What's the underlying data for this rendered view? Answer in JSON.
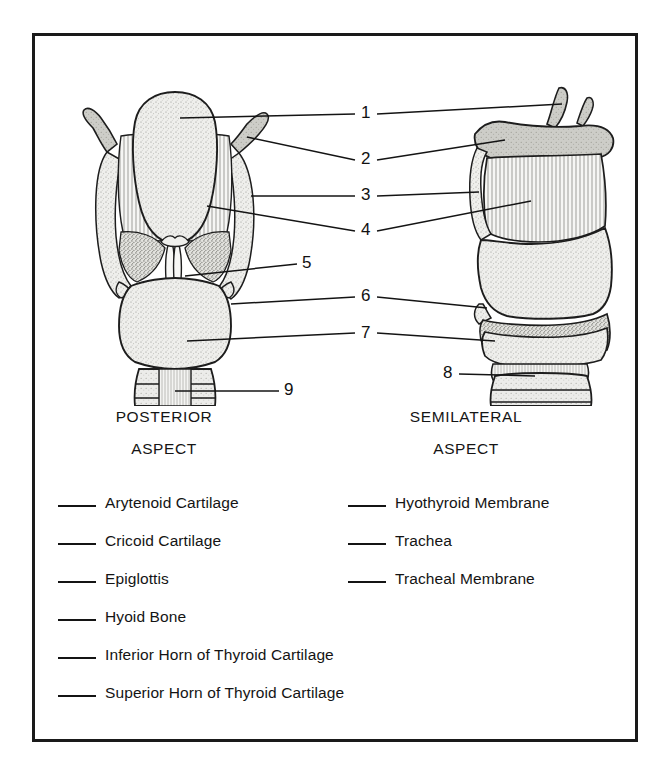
{
  "document": {
    "type": "anatomy-labeling-worksheet",
    "subject": "Larynx"
  },
  "figures": [
    {
      "id": "posterior",
      "caption_line1": "POSTERIOR",
      "caption_line2": "ASPECT"
    },
    {
      "id": "semilateral",
      "caption_line1": "SEMILATERAL",
      "caption_line2": "ASPECT"
    }
  ],
  "callouts": [
    {
      "number": "1",
      "x": 330,
      "y": 78,
      "target": "epiglottis"
    },
    {
      "number": "2",
      "x": 330,
      "y": 121,
      "target": "superior-horn-of-thyroid-cartilage"
    },
    {
      "number": "3",
      "x": 330,
      "y": 160,
      "target": "hyothyroid-membrane"
    },
    {
      "number": "4",
      "x": 330,
      "y": 192,
      "target": "hyothyroid-membrane-body"
    },
    {
      "number": "5",
      "x": 271,
      "y": 228,
      "target": "arytenoid-cartilage"
    },
    {
      "number": "6",
      "x": 330,
      "y": 261,
      "target": "inferior-horn-of-thyroid-cartilage"
    },
    {
      "number": "7",
      "x": 330,
      "y": 297,
      "target": "cricoid-cartilage"
    },
    {
      "number": "8",
      "x": 412,
      "y": 338,
      "target": "tracheal-membrane"
    },
    {
      "number": "9",
      "x": 253,
      "y": 353,
      "target": "trachea"
    }
  ],
  "answer_key": {
    "left_column": [
      {
        "label": "Arytenoid Cartilage"
      },
      {
        "label": "Cricoid Cartilage"
      },
      {
        "label": "Epiglottis"
      },
      {
        "label": "Hyoid Bone"
      },
      {
        "label": "Inferior Horn of Thyroid Cartilage"
      },
      {
        "label": "Superior Horn of Thyroid Cartilage"
      }
    ],
    "right_column": [
      {
        "label": "Hyothyroid Membrane"
      },
      {
        "label": "Trachea"
      },
      {
        "label": "Tracheal Membrane"
      }
    ]
  },
  "colors": {
    "ink": "#141414",
    "frame": "#1a1a1a",
    "cartilage_fill": "#ebebe8",
    "membrane_fill": "#f1f1ef",
    "bone_fill": "#d9d9d5",
    "paper": "#ffffff"
  }
}
